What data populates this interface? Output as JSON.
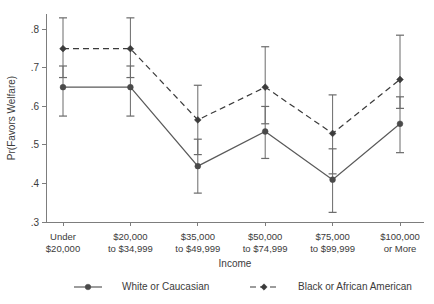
{
  "chart_data": {
    "type": "line",
    "title": "",
    "xlabel": "Income",
    "ylabel": "Pr(Favors Welfare)",
    "ylim": [
      0.3,
      0.84
    ],
    "yticks": [
      0.3,
      0.4,
      0.5,
      0.6,
      0.7,
      0.8
    ],
    "ytick_labels": [
      ".3",
      ".4",
      ".5",
      ".6",
      ".7",
      ".8"
    ],
    "grid": false,
    "legend_position": "bottom",
    "categories": [
      "Under\n$20,000",
      "$20,000\nto $34,999",
      "$35,000\nto $49,999",
      "$50,000\nto $74,999",
      "$75,000\nto $99,999",
      "$100,000\nor More"
    ],
    "category_lines": [
      [
        "Under",
        "$20,000"
      ],
      [
        "$20,000",
        "to $34,999"
      ],
      [
        "$35,000",
        "to $49,999"
      ],
      [
        "$50,000",
        "to $74,999"
      ],
      [
        "$75,000",
        "to $99,999"
      ],
      [
        "$100,000",
        "or More"
      ]
    ],
    "series": [
      {
        "name": "White or Caucasian",
        "style": "solid",
        "marker": "circle",
        "color": "#4a4a4a",
        "values": [
          0.65,
          0.65,
          0.445,
          0.535,
          0.41,
          0.555
        ],
        "ci_low": [
          0.575,
          0.575,
          0.375,
          0.465,
          0.325,
          0.48
        ],
        "ci_high": [
          0.705,
          0.705,
          0.515,
          0.6,
          0.49,
          0.625
        ]
      },
      {
        "name": "Black or African American",
        "style": "dashed",
        "marker": "diamond",
        "color": "#3b3b3b",
        "values": [
          0.75,
          0.75,
          0.565,
          0.65,
          0.53,
          0.67
        ],
        "ci_low": [
          0.675,
          0.675,
          0.475,
          0.555,
          0.425,
          0.595
        ],
        "ci_high": [
          0.83,
          0.83,
          0.655,
          0.755,
          0.63,
          0.785
        ]
      }
    ]
  },
  "legend": {
    "items": [
      {
        "label": "White or Caucasian"
      },
      {
        "label": "Black or African American"
      }
    ]
  }
}
